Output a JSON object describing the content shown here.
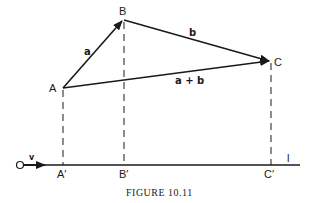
{
  "figure": {
    "caption": "FIGURE 10.11",
    "colors": {
      "ink": "#1a1a1a",
      "background": "#ffffff"
    }
  },
  "points": {
    "A": {
      "label": "A",
      "x": 63,
      "y": 88
    },
    "B": {
      "label": "B",
      "x": 123,
      "y": 20
    },
    "C": {
      "label": "C",
      "x": 271,
      "y": 61
    }
  },
  "vectors": {
    "a": {
      "label": "a",
      "from": "A",
      "to": "B"
    },
    "b": {
      "label": "b",
      "from": "B",
      "to": "C"
    },
    "sum": {
      "label": "a + b",
      "from": "A",
      "to": "C"
    }
  },
  "axis": {
    "origin_label": "O",
    "unit_vector_label": "v",
    "line_label": "l",
    "y": 165,
    "projections": [
      {
        "label": "A′",
        "x": 63
      },
      {
        "label": "B′",
        "x": 124
      },
      {
        "label": "C′",
        "x": 271
      }
    ]
  }
}
